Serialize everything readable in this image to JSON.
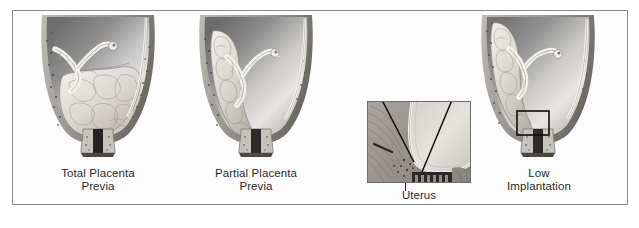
{
  "figure": {
    "background_color": "#ffffff",
    "frame_color": "#8b8b8b",
    "caption_color": "#2a2a2a",
    "art_style": "grayscale medical halftone illustration"
  },
  "panels": [
    {
      "id": "total-placenta-previa",
      "caption": "Total Placenta\nPrevia",
      "caption_line_1": "Total Placenta",
      "caption_line_2": "Previa",
      "art_name": "uterus-total-previa-illustration",
      "description": "Sagittal uterus with placenta completely covering the internal cervical os"
    },
    {
      "id": "partial-placenta-previa",
      "caption": "Partial Placenta\nPrevia",
      "caption_line_1": "Partial Placenta",
      "caption_line_2": "Previa",
      "art_name": "uterus-partial-previa-illustration",
      "description": "Sagittal uterus with placenta partially covering the internal cervical os"
    },
    {
      "id": "low-implantation",
      "caption": "Low\nImplantation",
      "caption_line_1": "Low",
      "caption_line_2": "Implantation",
      "art_name": "uterus-low-implantation-illustration",
      "description": "Sagittal uterus with placenta implanted low but not covering the os; black callout rectangle marks the detail region"
    }
  ],
  "inset": {
    "id": "uterus-detail",
    "caption": "Uterus",
    "art_name": "uterus-wall-detail-illustration",
    "description": "Magnified detail of the lower uterine segment and cervix with two black leader lines"
  }
}
